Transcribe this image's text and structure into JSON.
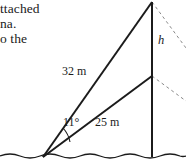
{
  "page": {
    "width": 186,
    "height": 166,
    "background": "#ffffff",
    "ink_color": "#1b1b1b"
  },
  "text_block": {
    "lines": [
      "ttached",
      "na.",
      "o the"
    ]
  },
  "diagram": {
    "labels": {
      "hypotenuse_upper": "32 m",
      "hypotenuse_lower": "25 m",
      "angle": "11°",
      "height": "h"
    },
    "geometry": {
      "observer_vertex": {
        "x": 43,
        "y": 157
      },
      "pole_top": {
        "x": 152,
        "y": 2
      },
      "pole_mid": {
        "x": 152,
        "y": 76
      },
      "pole_base": {
        "x": 152,
        "y": 157
      },
      "ground_y": 157,
      "dashed_upper_end": {
        "x": 186,
        "y": 48
      },
      "dashed_lower_end": {
        "x": 186,
        "y": 101
      }
    },
    "style": {
      "solid_stroke": "#1b1b1b",
      "dashed_stroke": "#8a8a8a",
      "ground_stroke": "#1b1b1b"
    }
  }
}
